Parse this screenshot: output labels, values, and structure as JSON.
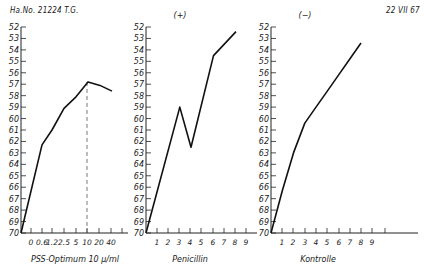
{
  "header": {
    "left": "Ha.No. 21224  T.G.",
    "right": "22 VII 67"
  },
  "chart_data": [
    {
      "type": "line",
      "panel_label": "",
      "xlabel": "PSS-Optimum  10 μ/ml",
      "ylabel": "",
      "y_inverted": true,
      "ylim": [
        52,
        70
      ],
      "yticks": [
        52,
        53,
        54,
        55,
        56,
        57,
        58,
        59,
        60,
        61,
        62,
        63,
        64,
        65,
        66,
        67,
        68,
        69,
        70
      ],
      "xtick_labels": [
        "0",
        "0.6",
        "1.2",
        "2.5",
        "5",
        "10",
        "20",
        "40",
        ""
      ],
      "grid": false,
      "annotations": [
        {
          "type": "dashed-vertical",
          "at": "10"
        }
      ],
      "x": [
        "origin",
        "0.6",
        "1.2",
        "2.5",
        "5",
        "10",
        "20",
        "40"
      ],
      "values": [
        70,
        62.3,
        61.0,
        59.1,
        58.1,
        56.8,
        57.1,
        57.6
      ]
    },
    {
      "type": "line",
      "panel_label": "(+)",
      "xlabel": "Penicillin",
      "ylabel": "",
      "y_inverted": true,
      "ylim": [
        52,
        70
      ],
      "yticks": [
        52,
        53,
        54,
        55,
        56,
        57,
        58,
        59,
        60,
        61,
        62,
        63,
        64,
        65,
        66,
        67,
        68,
        69,
        70
      ],
      "xtick_labels": [
        "1",
        "2",
        "3",
        "4",
        "5",
        "6",
        "7",
        "8",
        "9"
      ],
      "grid": false,
      "x": [
        0,
        3,
        4,
        6,
        8
      ],
      "values": [
        70,
        59.0,
        62.5,
        54.5,
        52.4
      ]
    },
    {
      "type": "line",
      "panel_label": "(−)",
      "xlabel": "Kontrolle",
      "ylabel": "",
      "y_inverted": true,
      "ylim": [
        52,
        70
      ],
      "yticks": [
        52,
        53,
        54,
        55,
        56,
        57,
        58,
        59,
        60,
        61,
        62,
        63,
        64,
        65,
        66,
        67,
        68,
        69,
        70
      ],
      "xtick_labels": [
        "1",
        "2",
        "3",
        "4",
        "5",
        "6",
        "7",
        "8",
        "9",
        ""
      ],
      "grid": false,
      "x": [
        0,
        1,
        2,
        3,
        4,
        5,
        6,
        7,
        8
      ],
      "values": [
        70,
        66.3,
        63.0,
        60.4,
        59.0,
        57.6,
        56.2,
        54.8,
        53.4
      ]
    }
  ]
}
